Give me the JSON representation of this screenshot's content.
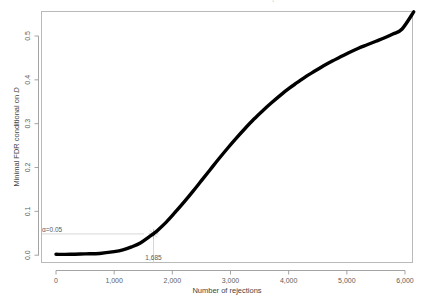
{
  "figure": {
    "title": "Minimal FDR conditional on D vs number of rejections",
    "background_color": "#ffffff",
    "curve_color": "#000000",
    "guide_color": "#cdcdcd",
    "axis_color": "#9a9a9a",
    "width": 427,
    "height": 305
  },
  "axes": {
    "x_title": "Number of rejections",
    "y_title_plain": "Minimal FDR conditional on ",
    "y_title_italic": "D",
    "x_ticks": [
      "0",
      "1,000",
      "2,000",
      "3,000",
      "4,000",
      "5,000",
      "6,000"
    ],
    "y_ticks": [
      "0.0",
      "0.1",
      "0.2",
      "0.3",
      "0.4",
      "0.5"
    ]
  },
  "annotations": {
    "alpha_label": "α=0.05",
    "threshold_label": "1,685"
  },
  "chart_data": {
    "type": "line",
    "title": "Minimal FDR conditional on D vs number of rejections",
    "xlabel": "Number of rejections",
    "ylabel": "Minimal FDR conditional on D",
    "xlim": [
      0,
      6150
    ],
    "ylim": [
      0.0,
      0.56
    ],
    "x_tick_values": [
      0,
      1000,
      2000,
      3000,
      4000,
      5000,
      6000
    ],
    "y_tick_values": [
      0.0,
      0.1,
      0.2,
      0.3,
      0.4,
      0.5
    ],
    "grid": false,
    "legend": false,
    "series": [
      {
        "name": "Minimal FDR conditional on D",
        "color": "#000000",
        "x": [
          0,
          250,
          500,
          750,
          1000,
          1150,
          1300,
          1450,
          1600,
          1685,
          1750,
          1900,
          2050,
          2200,
          2350,
          2500,
          2650,
          2800,
          2950,
          3100,
          3250,
          3400,
          3550,
          3700,
          3850,
          4000,
          4150,
          4300,
          4450,
          4600,
          4750,
          4900,
          5050,
          5200,
          5350,
          5500,
          5650,
          5800,
          5950,
          6150
        ],
        "y": [
          0.002,
          0.002,
          0.003,
          0.004,
          0.008,
          0.012,
          0.019,
          0.028,
          0.042,
          0.05,
          0.057,
          0.076,
          0.098,
          0.121,
          0.145,
          0.17,
          0.195,
          0.22,
          0.244,
          0.267,
          0.289,
          0.31,
          0.329,
          0.347,
          0.364,
          0.38,
          0.394,
          0.408,
          0.42,
          0.432,
          0.443,
          0.453,
          0.463,
          0.472,
          0.48,
          0.488,
          0.496,
          0.505,
          0.516,
          0.555
        ]
      }
    ],
    "annotations": [
      {
        "kind": "horizontal-guide",
        "label": "α=0.05",
        "y_value": 0.05,
        "x_from": 0,
        "x_to": 1685
      },
      {
        "kind": "vertical-guide",
        "label": "1,685",
        "x_value": 1685,
        "y_from": 0.0,
        "y_to": 0.05
      }
    ]
  }
}
